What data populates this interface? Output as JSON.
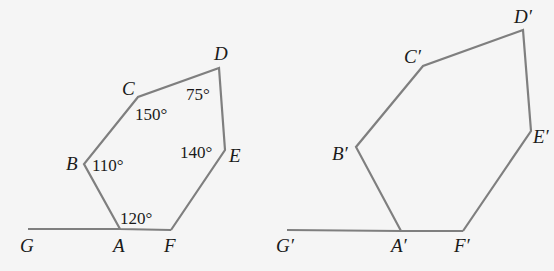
{
  "colors": {
    "background": "#f5f5f5",
    "stroke": "#7f7f7f",
    "text": "#1a1a1a"
  },
  "figure_left": {
    "points": {
      "G": [
        28,
        229
      ],
      "A": [
        120,
        229
      ],
      "F": [
        171,
        230
      ],
      "B": [
        84,
        164
      ],
      "C": [
        138,
        97
      ],
      "D": [
        219,
        68
      ],
      "E": [
        225,
        150
      ]
    },
    "labels": {
      "G": "G",
      "A": "A",
      "F": "F",
      "B": "B",
      "C": "C",
      "D": "D",
      "E": "E"
    },
    "angles": {
      "A": "120°",
      "B": "110°",
      "C": "150°",
      "D": "75°",
      "E": "140°"
    }
  },
  "figure_right": {
    "points": {
      "G": [
        287,
        230
      ],
      "A": [
        401,
        231
      ],
      "F": [
        463,
        231
      ],
      "B": [
        356,
        147
      ],
      "C": [
        423,
        66
      ],
      "D": [
        523,
        30
      ],
      "E": [
        531,
        131
      ]
    },
    "labels": {
      "G": "G′",
      "A": "A′",
      "F": "F′",
      "B": "B′",
      "C": "C′",
      "D": "D′",
      "E": "E′"
    }
  }
}
